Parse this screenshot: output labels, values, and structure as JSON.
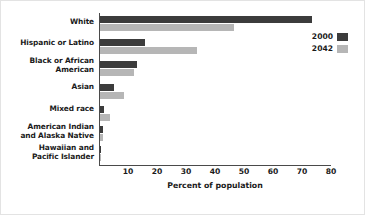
{
  "chart_data": {
    "type": "bar",
    "orientation": "horizontal",
    "title": "",
    "xlabel": "Percent of population",
    "ylabel": "",
    "xlim": [
      0,
      80
    ],
    "xticks": [
      10,
      20,
      30,
      40,
      50,
      60,
      70,
      80
    ],
    "grid": false,
    "legend_position": "top-right",
    "categories": [
      "White",
      "Hispanic or Latino",
      "Black or African American",
      "Asian",
      "Mixed race",
      "American Indian and Alaska Native",
      "Hawaiian and Pacific Islander"
    ],
    "category_lines": [
      [
        "White"
      ],
      [
        "Hispanic or Latino"
      ],
      [
        "Black or African",
        "American"
      ],
      [
        "Asian"
      ],
      [
        "Mixed race"
      ],
      [
        "American Indian",
        "and Alaska Native"
      ],
      [
        "Hawaiian and",
        "Pacific Islander"
      ]
    ],
    "series": [
      {
        "name": "2000",
        "color": "#3c3c3c",
        "values": [
          73.0,
          15.4,
          12.8,
          4.8,
          1.5,
          0.9,
          0.2
        ]
      },
      {
        "name": "2042",
        "color": "#b6b6b6",
        "values": [
          46.3,
          33.4,
          11.7,
          8.3,
          3.4,
          1.0,
          0.3
        ]
      }
    ]
  },
  "legend": {
    "items": [
      {
        "label": "2000",
        "color": "#3c3c3c"
      },
      {
        "label": "2042",
        "color": "#b6b6b6"
      }
    ]
  },
  "axis": {
    "xlabel": "Percent of population",
    "ticks": [
      "10",
      "20",
      "30",
      "40",
      "50",
      "60",
      "70",
      "80"
    ]
  }
}
